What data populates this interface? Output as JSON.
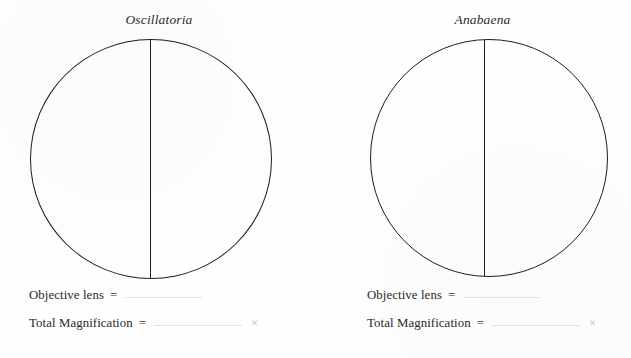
{
  "document": {
    "kind": "microscope-field-of-view-worksheet",
    "background_color": "#fefefe",
    "ink_color": "#1d1d1d",
    "blank_line_color": "#e2e2e2"
  },
  "panels": [
    {
      "specimen_name": "Oscillatoria",
      "objective_lens_label": "Objective lens",
      "objective_lens_equals": "=",
      "objective_lens_value": "",
      "total_magnification_label": "Total Magnification",
      "total_magnification_equals": "=",
      "total_magnification_value": "",
      "times_symbol": "×"
    },
    {
      "specimen_name": "Anabaena",
      "objective_lens_label": "Objective lens",
      "objective_lens_equals": "=",
      "objective_lens_value": "",
      "total_magnification_label": "Total Magnification",
      "total_magnification_equals": "=",
      "total_magnification_value": "",
      "times_symbol": "×"
    }
  ]
}
